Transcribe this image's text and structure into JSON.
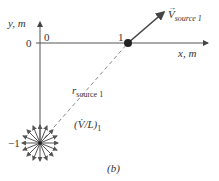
{
  "diagram": {
    "y_axis_label": "y, m",
    "x_axis_label": "x, m",
    "origin_x_tick": "0",
    "origin_y_tick": "0",
    "x_tick_1": "1",
    "y_tick_neg1": "−1",
    "velocity_symbol": "V",
    "velocity_subscript": "source 1",
    "r_symbol": "r",
    "r_subscript": "source 1",
    "source_strength_label": "(V̇/L)",
    "source_strength_subscript": "1",
    "panel_label": "(b)",
    "colors": {
      "axis": "#555555",
      "arrow": "#444444",
      "dashed": "#888888",
      "point": "#222222"
    }
  }
}
